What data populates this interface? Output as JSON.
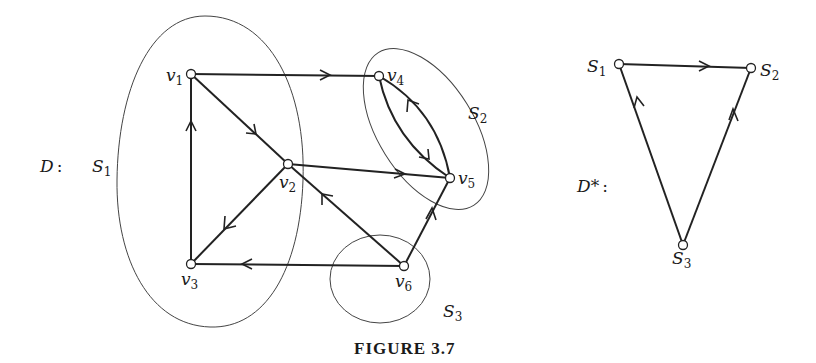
{
  "figure": {
    "caption": "FIGURE 3.7",
    "digraph_D": {
      "label": "D:",
      "vertices": [
        {
          "id": "v1",
          "name": "v",
          "sub": "1",
          "x": 191,
          "y": 74
        },
        {
          "id": "v2",
          "name": "v",
          "sub": "2",
          "x": 288,
          "y": 164
        },
        {
          "id": "v3",
          "name": "v",
          "sub": "3",
          "x": 191,
          "y": 264
        },
        {
          "id": "v4",
          "name": "v",
          "sub": "4",
          "x": 379,
          "y": 76
        },
        {
          "id": "v5",
          "name": "v",
          "sub": "5",
          "x": 450,
          "y": 178
        },
        {
          "id": "v6",
          "name": "v",
          "sub": "6",
          "x": 404,
          "y": 266
        }
      ],
      "arcs": [
        {
          "from": "v1",
          "to": "v4"
        },
        {
          "from": "v1",
          "to": "v2"
        },
        {
          "from": "v3",
          "to": "v1"
        },
        {
          "from": "v2",
          "to": "v3"
        },
        {
          "from": "v2",
          "to": "v5"
        },
        {
          "from": "v4",
          "to": "v5"
        },
        {
          "from": "v5",
          "to": "v4"
        },
        {
          "from": "v6",
          "to": "v2"
        },
        {
          "from": "v6",
          "to": "v3"
        },
        {
          "from": "v6",
          "to": "v5"
        }
      ],
      "strong_components": [
        {
          "id": "S1",
          "name": "S",
          "sub": "1",
          "members": [
            "v1",
            "v2",
            "v3"
          ]
        },
        {
          "id": "S2",
          "name": "S",
          "sub": "2",
          "members": [
            "v4",
            "v5"
          ]
        },
        {
          "id": "S3",
          "name": "S",
          "sub": "3",
          "members": [
            "v6"
          ]
        }
      ]
    },
    "condensation_D_star": {
      "label": "D*:",
      "vertices": [
        {
          "id": "S1",
          "name": "S",
          "sub": "1",
          "x": 619,
          "y": 64
        },
        {
          "id": "S2",
          "name": "S",
          "sub": "2",
          "x": 751,
          "y": 68
        },
        {
          "id": "S3",
          "name": "S",
          "sub": "3",
          "x": 683,
          "y": 245
        }
      ],
      "arcs": [
        {
          "from": "S1",
          "to": "S2"
        },
        {
          "from": "S3",
          "to": "S1"
        },
        {
          "from": "S3",
          "to": "S2"
        }
      ]
    }
  },
  "labels": {
    "D": "D",
    "colon": ":",
    "Dstar": "D*",
    "S": "S",
    "v": "v",
    "one": "1",
    "two": "2",
    "three": "3",
    "four": "4",
    "five": "5",
    "six": "6"
  }
}
